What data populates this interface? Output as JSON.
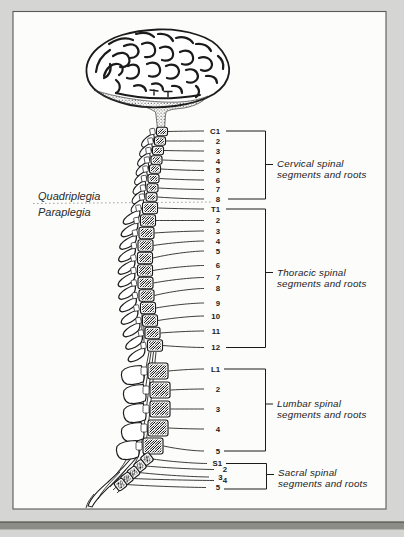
{
  "page": {
    "colors": {
      "background": "#d5d5d3",
      "panel": "#fcfcfb",
      "ink": "#1b1b1b",
      "accent_bar": "#8d8d87",
      "panel_border": "#5a5a5a",
      "dashed_line": "#9a9a98"
    }
  },
  "figure": {
    "condition_labels": {
      "quadriplegia": "Quadriplegia",
      "paraplegia": "Paraplegia"
    },
    "segments": {
      "cervical": [
        "C1",
        "2",
        "3",
        "4",
        "5",
        "6",
        "7",
        "8"
      ],
      "thoracic": [
        "T1",
        "2",
        "3",
        "4",
        "5",
        "6",
        "7",
        "8",
        "9",
        "10",
        "11",
        "12"
      ],
      "lumbar": [
        "L1",
        "2",
        "3",
        "4",
        "5"
      ],
      "sacral": [
        "S1",
        "2",
        "3",
        "4",
        "5"
      ]
    },
    "groups": {
      "cervical": {
        "line1": "Cervical spinal",
        "line2": "segments and roots"
      },
      "thoracic": {
        "line1": "Thoracic spinal",
        "line2": "segments and roots"
      },
      "lumbar": {
        "line1": "Lumbar spinal",
        "line2": "segments and roots"
      },
      "sacral": {
        "line1": "Sacral spinal",
        "line2": "segments and roots"
      }
    }
  }
}
